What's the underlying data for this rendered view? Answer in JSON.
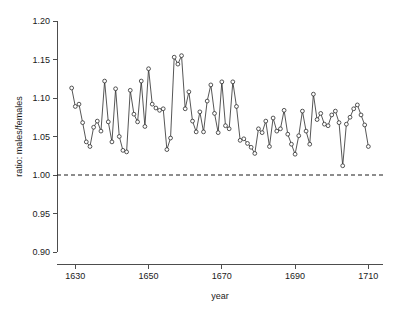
{
  "chart_data": {
    "type": "line",
    "title": "",
    "subtitle": "",
    "xlabel": "year",
    "ylabel": "ratio: males/females",
    "xlim": [
      1625,
      1714
    ],
    "ylim": [
      0.9,
      1.2
    ],
    "xticks": [
      1630,
      1650,
      1670,
      1690,
      1710
    ],
    "xtick_labels": [
      "1630",
      "1650",
      "1670",
      "1690",
      "1710"
    ],
    "yticks": [
      0.9,
      0.95,
      1.0,
      1.05,
      1.1,
      1.15,
      1.2
    ],
    "ytick_labels": [
      "0.90",
      "0.95",
      "1.00",
      "1.05",
      "1.10",
      "1.15",
      "1.20"
    ],
    "grid": false,
    "legend": null,
    "marker": "open-circle",
    "line_color": "#2b2b2b",
    "marker_fill": "#ffffff",
    "reference_line": {
      "value": 1.0,
      "style": "dashed",
      "color": "#1a1a1a",
      "label": ""
    },
    "x": [
      1629,
      1630,
      1631,
      1632,
      1633,
      1634,
      1635,
      1636,
      1637,
      1638,
      1639,
      1640,
      1641,
      1642,
      1643,
      1644,
      1645,
      1646,
      1647,
      1648,
      1649,
      1650,
      1651,
      1652,
      1653,
      1654,
      1655,
      1656,
      1657,
      1658,
      1659,
      1660,
      1661,
      1662,
      1663,
      1664,
      1665,
      1666,
      1667,
      1668,
      1669,
      1670,
      1671,
      1672,
      1673,
      1674,
      1675,
      1676,
      1677,
      1678,
      1679,
      1680,
      1681,
      1682,
      1683,
      1684,
      1685,
      1686,
      1687,
      1688,
      1689,
      1690,
      1691,
      1692,
      1693,
      1694,
      1695,
      1696,
      1697,
      1698,
      1699,
      1700,
      1701,
      1702,
      1703,
      1704,
      1705,
      1706,
      1707,
      1708,
      1709,
      1710
    ],
    "y": [
      1.113,
      1.089,
      1.092,
      1.068,
      1.043,
      1.037,
      1.062,
      1.07,
      1.057,
      1.122,
      1.069,
      1.043,
      1.112,
      1.05,
      1.032,
      1.03,
      1.11,
      1.079,
      1.069,
      1.122,
      1.063,
      1.138,
      1.092,
      1.087,
      1.084,
      1.086,
      1.033,
      1.048,
      1.153,
      1.144,
      1.155,
      1.086,
      1.108,
      1.07,
      1.056,
      1.082,
      1.056,
      1.096,
      1.117,
      1.08,
      1.055,
      1.121,
      1.064,
      1.06,
      1.121,
      1.089,
      1.045,
      1.047,
      1.041,
      1.036,
      1.028,
      1.06,
      1.055,
      1.07,
      1.037,
      1.074,
      1.057,
      1.06,
      1.084,
      1.053,
      1.04,
      1.027,
      1.051,
      1.083,
      1.057,
      1.04,
      1.105,
      1.072,
      1.08,
      1.066,
      1.064,
      1.078,
      1.083,
      1.068,
      1.012,
      1.066,
      1.075,
      1.086,
      1.091,
      1.078,
      1.065,
      1.037
    ],
    "series": [
      {
        "name": "male/female christenings ratio",
        "values": [
          1.113,
          1.089,
          1.092,
          1.068,
          1.043,
          1.037,
          1.062,
          1.07,
          1.057,
          1.122,
          1.069,
          1.043,
          1.112,
          1.05,
          1.032,
          1.03,
          1.11,
          1.079,
          1.069,
          1.122,
          1.063,
          1.138,
          1.092,
          1.087,
          1.084,
          1.086,
          1.033,
          1.048,
          1.153,
          1.144,
          1.155,
          1.086,
          1.108,
          1.07,
          1.056,
          1.082,
          1.056,
          1.096,
          1.117,
          1.08,
          1.055,
          1.121,
          1.064,
          1.06,
          1.121,
          1.089,
          1.045,
          1.047,
          1.041,
          1.036,
          1.028,
          1.06,
          1.055,
          1.07,
          1.037,
          1.074,
          1.057,
          1.06,
          1.084,
          1.053,
          1.04,
          1.027,
          1.051,
          1.083,
          1.057,
          1.04,
          1.105,
          1.072,
          1.08,
          1.066,
          1.064,
          1.078,
          1.083,
          1.068,
          1.012,
          1.066,
          1.075,
          1.086,
          1.091,
          1.078,
          1.065,
          1.037
        ]
      }
    ]
  }
}
